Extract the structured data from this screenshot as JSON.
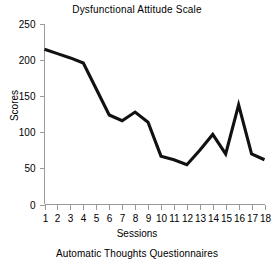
{
  "chart_data": {
    "type": "line",
    "title": "Dysfunctional Attitude Scale",
    "caption": "Automatic Thoughts Questionnaires",
    "xlabel": "Sessions",
    "ylabel": "Scores",
    "x": [
      1,
      2,
      3,
      4,
      5,
      6,
      7,
      8,
      9,
      10,
      11,
      12,
      13,
      14,
      15,
      16,
      17,
      18
    ],
    "xtick_labels": [
      "1",
      "2",
      "3",
      "4",
      "5",
      "6",
      "7",
      "8",
      "9",
      "10",
      "11",
      "12",
      "13",
      "14",
      "15",
      "16",
      "17",
      "18"
    ],
    "values": [
      215,
      209,
      203,
      196,
      160,
      124,
      116,
      128,
      114,
      67,
      62,
      55,
      75,
      97,
      70,
      138,
      70,
      62
    ],
    "ytick_labels": [
      "0",
      "50",
      "100",
      "150",
      "200",
      "250"
    ],
    "ytick_values": [
      0,
      50,
      100,
      150,
      200,
      250
    ],
    "ylim": [
      0,
      250
    ],
    "xlim": [
      1,
      18
    ],
    "grid": false,
    "legend": null,
    "line_color": "#111111",
    "axis_color": "#9a9a9a",
    "background": "#ffffff"
  }
}
